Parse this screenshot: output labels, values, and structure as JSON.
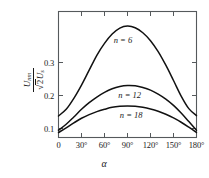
{
  "chart_data": {
    "type": "line",
    "title": "",
    "xlabel": "α",
    "ylabel_numerator": "U",
    "ylabel_numerator_sub": "nm",
    "ylabel_denominator_radical": "2",
    "ylabel_denominator_tail": "U",
    "ylabel_denominator_sub": "s",
    "xlim": [
      0,
      180
    ],
    "ylim": [
      0,
      0.38
    ],
    "grid": false,
    "legend": "inline-curve-labels",
    "xtick_labels": [
      "0",
      "30°",
      "60°",
      "90°",
      "120°",
      "150°",
      "180°"
    ],
    "xtick_values": [
      0,
      30,
      60,
      90,
      120,
      150,
      180
    ],
    "ytick_labels": [
      "0.1",
      "0.2",
      "0.3"
    ],
    "ytick_values": [
      0.1,
      0.2,
      0.3
    ],
    "x": [
      0,
      10,
      20,
      30,
      40,
      50,
      60,
      70,
      80,
      90,
      100,
      110,
      120,
      130,
      140,
      150,
      160,
      170,
      180
    ],
    "series": [
      {
        "name": "n = 6",
        "label": "n = 6",
        "values": [
          0.065,
          0.085,
          0.118,
          0.158,
          0.203,
          0.248,
          0.284,
          0.312,
          0.33,
          0.336,
          0.331,
          0.316,
          0.292,
          0.259,
          0.218,
          0.172,
          0.125,
          0.087,
          0.066
        ],
        "color": "#111111"
      },
      {
        "name": "n = 12",
        "label": "n = 12",
        "values": [
          0.022,
          0.04,
          0.062,
          0.085,
          0.105,
          0.122,
          0.136,
          0.147,
          0.154,
          0.157,
          0.156,
          0.151,
          0.143,
          0.131,
          0.116,
          0.097,
          0.074,
          0.048,
          0.022
        ],
        "color": "#111111"
      },
      {
        "name": "n = 18",
        "label": "n = 18",
        "values": [
          0.015,
          0.029,
          0.044,
          0.058,
          0.069,
          0.078,
          0.085,
          0.091,
          0.094,
          0.095,
          0.094,
          0.091,
          0.086,
          0.079,
          0.07,
          0.059,
          0.046,
          0.031,
          0.015
        ],
        "color": "#111111"
      }
    ],
    "curve_label_positions": [
      {
        "label": "n = 6",
        "x": 72,
        "y": 0.295
      },
      {
        "label": "n = 12",
        "x": 78,
        "y": 0.128
      },
      {
        "label": "n = 18",
        "x": 80,
        "y": 0.068
      }
    ],
    "axis_color": "#4a4a4a",
    "curve_color": "#111111",
    "background": "#ffffff"
  }
}
